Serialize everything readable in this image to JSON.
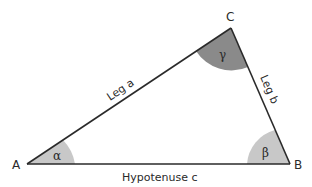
{
  "diagram": {
    "type": "triangle",
    "colors": {
      "line": "#2a2a2a",
      "arc_light": "#c8c8c8",
      "arc_dark": "#8a8a8a",
      "background": "#ffffff"
    },
    "vertices": {
      "A": {
        "label": "A",
        "x": 27,
        "y": 164
      },
      "B": {
        "label": "B",
        "x": 290,
        "y": 164
      },
      "C": {
        "label": "C",
        "x": 231,
        "y": 28
      }
    },
    "angles": {
      "alpha": {
        "label": "α",
        "vertex": "A"
      },
      "beta": {
        "label": "β",
        "vertex": "B"
      },
      "gamma": {
        "label": "γ",
        "vertex": "C"
      }
    },
    "sides": {
      "a": {
        "label": "Leg a",
        "from": "A",
        "to": "C"
      },
      "b": {
        "label": "Leg b",
        "from": "C",
        "to": "B"
      },
      "c": {
        "label": "Hypotenuse c",
        "from": "A",
        "to": "B"
      }
    }
  }
}
